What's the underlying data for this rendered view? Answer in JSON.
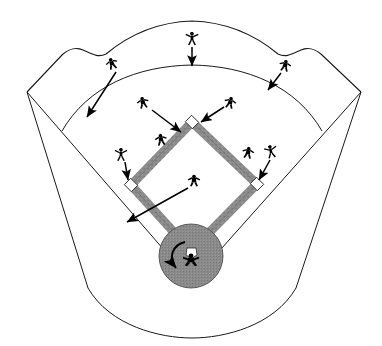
{
  "diagram": {
    "type": "baseball-field-schematic",
    "width": 382,
    "height": 346,
    "colors": {
      "background": "#ffffff",
      "outline": "#1a1a1a",
      "base_path_fill": "#8e8e8e",
      "home_circle_fill": "#8a8a8a",
      "base_fill": "#ffffff",
      "player_fill": "#000000",
      "arrow": "#000000"
    }
  },
  "field": {
    "outfield_fence_label": "outfield fence",
    "infield_arc_label": "infield grass arc",
    "foul_line_left_label": "left foul line",
    "foul_line_right_label": "right foul line",
    "backstop_label": "backstop arc",
    "left_corner": "27,92",
    "right_corner": "361,92"
  },
  "bases": [
    {
      "name": "home-plate",
      "label": "Home Plate",
      "x": 191,
      "y": 251
    },
    {
      "name": "first-base",
      "label": "First Base",
      "x": 257,
      "y": 184
    },
    {
      "name": "second-base",
      "label": "Second Base",
      "x": 192,
      "y": 122
    },
    {
      "name": "third-base",
      "label": "Third Base",
      "x": 131,
      "y": 185
    }
  ],
  "players": [
    {
      "name": "center-fielder",
      "label": "Center Fielder",
      "x": 192,
      "y": 39,
      "arrow": "down"
    },
    {
      "name": "left-fielder",
      "label": "Left Fielder",
      "x": 112,
      "y": 64,
      "arrow": "down-left to fence"
    },
    {
      "name": "right-fielder",
      "label": "Right Fielder",
      "x": 285,
      "y": 66,
      "arrow": "down-left to fence"
    },
    {
      "name": "shortstop",
      "label": "Shortstop",
      "x": 143,
      "y": 103,
      "arrow": "down-right to second base"
    },
    {
      "name": "second-baseman",
      "label": "Second Baseman",
      "x": 230,
      "y": 103,
      "arrow": "left to second base"
    },
    {
      "name": "third-base-backup",
      "label": "Third Base Backup Fielder",
      "x": 161,
      "y": 140,
      "arrow": "none"
    },
    {
      "name": "third-baseman",
      "label": "Third Baseman",
      "x": 121,
      "y": 155,
      "arrow": "down to third base"
    },
    {
      "name": "first-baseman",
      "label": "First Baseman",
      "x": 248,
      "y": 153,
      "arrow": "none"
    },
    {
      "name": "first-base-cover",
      "label": "First Base Cover Fielder",
      "x": 271,
      "y": 152,
      "arrow": "down-left to first base"
    },
    {
      "name": "pitcher",
      "label": "Pitcher",
      "x": 194,
      "y": 181,
      "arrow": "down-left across infield"
    },
    {
      "name": "catcher",
      "label": "Catcher",
      "x": 191,
      "y": 260,
      "arrow": "counterclockwise rotation"
    }
  ],
  "annotations": {
    "rotation_arrow_label": "catcher rotation arrow",
    "movement_arrow_label": "player movement arrow"
  }
}
